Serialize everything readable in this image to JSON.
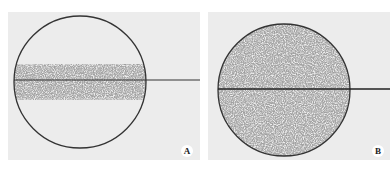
{
  "figure": {
    "panels": [
      {
        "id": "A",
        "label": "A",
        "description": "Empty circle with horizontal band of dispersed particles across center; line extends right from circle edge"
      },
      {
        "id": "B",
        "label": "B",
        "description": "Circle uniformly filled with particles; horizontal line through center extending right"
      }
    ],
    "colors": {
      "background": "#ececec",
      "outline": "#333333",
      "particles": "#6a6a6a"
    }
  }
}
